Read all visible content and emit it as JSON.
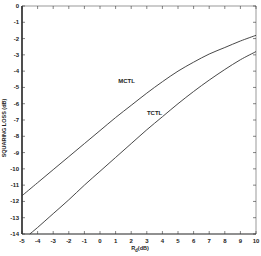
{
  "chart_data": {
    "type": "line",
    "title": "",
    "xlabel": "R",
    "xlabel_subscript": "d",
    "xlabel_suffix": "(dB)",
    "ylabel": "SQUARING LOSS (dB)",
    "xlim": [
      -5,
      10
    ],
    "ylim": [
      -14,
      0
    ],
    "xticks": [
      -5,
      -4,
      -3,
      -2,
      -1,
      0,
      1,
      2,
      3,
      4,
      5,
      6,
      7,
      8,
      9,
      10
    ],
    "yticks": [
      0,
      -1,
      -2,
      -3,
      -4,
      -5,
      -6,
      -7,
      -8,
      -9,
      -10,
      -11,
      -12,
      -13,
      -14
    ],
    "grid": false,
    "legend": "inline labels",
    "series": [
      {
        "name": "MCTL",
        "x": [
          -5,
          -4,
          -3,
          -2,
          -1,
          0,
          1,
          2,
          3,
          4,
          5,
          6,
          7,
          8,
          9,
          10
        ],
        "values": [
          -11.65,
          -10.85,
          -10.05,
          -9.25,
          -8.45,
          -7.65,
          -6.85,
          -6.1,
          -5.35,
          -4.65,
          -4.0,
          -3.45,
          -2.95,
          -2.55,
          -2.15,
          -1.8
        ],
        "label_at": [
          1.7,
          -4.7
        ]
      },
      {
        "name": "TCTL",
        "x": [
          -4.5,
          -4,
          -3,
          -2,
          -1,
          0,
          1,
          2,
          3,
          4,
          5,
          6,
          7,
          8,
          9,
          10
        ],
        "values": [
          -14,
          -13.6,
          -12.75,
          -11.9,
          -11.0,
          -10.15,
          -9.3,
          -8.45,
          -7.6,
          -6.8,
          -6.0,
          -5.25,
          -4.55,
          -3.9,
          -3.3,
          -2.8
        ],
        "label_at": [
          3.5,
          -6.7
        ]
      }
    ]
  }
}
